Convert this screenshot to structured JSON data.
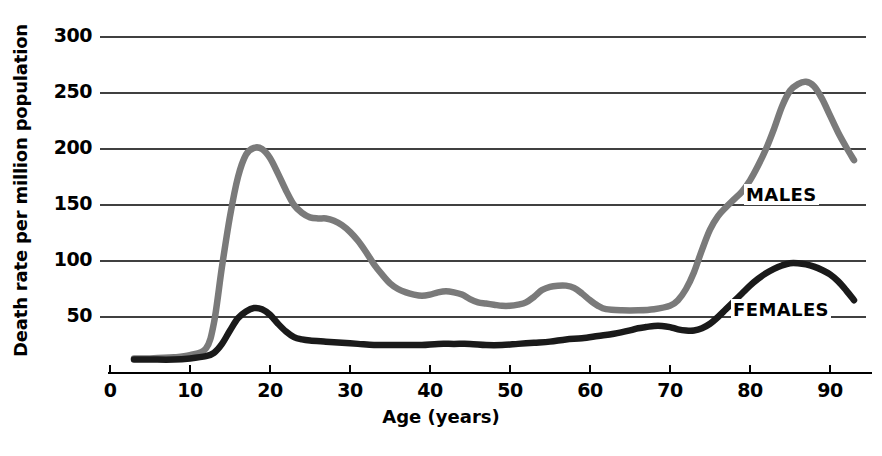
{
  "chart_data": {
    "type": "line",
    "title": "",
    "xlabel": "Age (years)",
    "ylabel": "Death rate per million population",
    "xlim": [
      0,
      95
    ],
    "ylim": [
      0,
      300
    ],
    "grid": true,
    "legend_position": "inline-right",
    "x_ticks": [
      "0",
      "10",
      "20",
      "30",
      "40",
      "50",
      "60",
      "70",
      "80",
      "90"
    ],
    "x_tick_values": [
      0,
      10,
      20,
      30,
      40,
      50,
      60,
      70,
      80,
      90
    ],
    "y_ticks": [
      "50",
      "100",
      "150",
      "200",
      "250",
      "300"
    ],
    "y_tick_values": [
      50,
      100,
      150,
      200,
      250,
      300
    ],
    "series": [
      {
        "name": "MALES",
        "color": "#7a7a7a",
        "x": [
          3,
          5,
          8,
          10,
          12,
          13,
          14,
          15,
          16,
          17,
          18,
          19,
          20,
          21,
          22,
          23,
          24,
          25,
          26,
          27,
          28,
          29,
          30,
          31,
          32,
          33,
          34,
          35,
          36,
          37,
          38,
          39,
          40,
          41,
          42,
          43,
          44,
          45,
          46,
          47,
          48,
          49,
          50,
          51,
          52,
          53,
          54,
          55,
          56,
          57,
          58,
          59,
          60,
          61,
          62,
          64,
          66,
          68,
          70,
          71,
          72,
          73,
          74,
          75,
          76,
          77,
          78,
          79,
          80,
          81,
          82,
          83,
          84,
          85,
          86,
          87,
          88,
          89,
          90,
          91,
          92,
          93
        ],
        "y": [
          13,
          13,
          14,
          16,
          22,
          45,
          95,
          140,
          175,
          195,
          201,
          200,
          192,
          178,
          163,
          150,
          143,
          139,
          138,
          138,
          136,
          132,
          126,
          118,
          108,
          97,
          88,
          80,
          75,
          72,
          70,
          69,
          70,
          72,
          73,
          72,
          70,
          66,
          63,
          62,
          61,
          60,
          60,
          61,
          63,
          68,
          74,
          77,
          78,
          78,
          76,
          71,
          65,
          60,
          57,
          56,
          56,
          57,
          60,
          65,
          75,
          90,
          110,
          128,
          140,
          148,
          155,
          162,
          172,
          185,
          200,
          218,
          238,
          252,
          258,
          260,
          256,
          245,
          230,
          215,
          202,
          190
        ]
      },
      {
        "name": "FEMALES",
        "color": "#1a1a1a",
        "x": [
          3,
          5,
          8,
          10,
          12,
          13,
          14,
          15,
          16,
          17,
          18,
          19,
          20,
          21,
          22,
          23,
          24,
          25,
          27,
          29,
          31,
          33,
          35,
          37,
          39,
          41,
          43,
          45,
          47,
          49,
          51,
          53,
          55,
          57,
          59,
          61,
          63,
          65,
          66,
          67,
          68,
          69,
          70,
          71,
          72,
          73,
          74,
          75,
          76,
          77,
          78,
          79,
          80,
          81,
          82,
          83,
          84,
          85,
          86,
          87,
          88,
          89,
          90,
          91,
          92,
          93
        ],
        "y": [
          12,
          12,
          12,
          13,
          15,
          18,
          26,
          38,
          49,
          55,
          58,
          57,
          52,
          44,
          37,
          32,
          30,
          29,
          28,
          27,
          26,
          25,
          25,
          25,
          25,
          26,
          26,
          26,
          25,
          25,
          26,
          27,
          28,
          30,
          31,
          33,
          35,
          38,
          40,
          41,
          42,
          42,
          41,
          39,
          38,
          38,
          40,
          44,
          50,
          57,
          64,
          71,
          78,
          84,
          89,
          93,
          96,
          98,
          98,
          97,
          95,
          92,
          88,
          82,
          74,
          65
        ]
      }
    ]
  },
  "axis": {
    "y_title": "Death rate per million population",
    "x_title": "Age (years)"
  },
  "labels": {
    "males": "MALES",
    "females": "FEMALES"
  }
}
